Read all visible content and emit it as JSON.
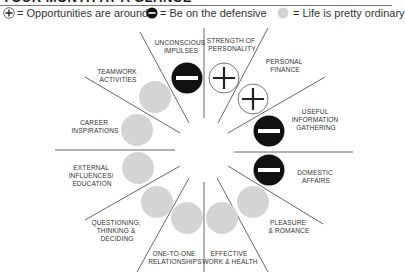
{
  "title": "YOUR MONTH AT A GLANCE",
  "legend": {
    "plus": "= Opportunities are around",
    "minus": "= Be on the defensive",
    "neutral": "= Life is pretty ordinary"
  },
  "colors": {
    "plus_fill": "#ffffff",
    "minus_fill": "#111111",
    "neutral_fill": "#d4d4d4",
    "line": "#555555"
  },
  "sectors": [
    {
      "name": "unconscious-impulses",
      "lines": [
        "UNCONSCIOUS",
        "IMPULSES"
      ],
      "status": "minus"
    },
    {
      "name": "strength-of-personality",
      "lines": [
        "STRENGTH OF",
        "PERSONALITY"
      ],
      "status": "plus"
    },
    {
      "name": "personal-finance",
      "lines": [
        "PERSONAL",
        "FINANCE"
      ],
      "status": "plus"
    },
    {
      "name": "useful-information-gathering",
      "lines": [
        "USEFUL",
        "INFORMATION",
        "GATHERING"
      ],
      "status": "minus"
    },
    {
      "name": "domestic-affairs",
      "lines": [
        "DOMESTIC",
        "AFFAIRS"
      ],
      "status": "minus"
    },
    {
      "name": "pleasure-romance",
      "lines": [
        "PLEASURE",
        "& ROMANCE"
      ],
      "status": "neutral"
    },
    {
      "name": "effective-work-health",
      "lines": [
        "EFFECTIVE",
        "WORK & HEALTH"
      ],
      "status": "neutral"
    },
    {
      "name": "one-to-one-relationships",
      "lines": [
        "ONE-TO-ONE",
        "RELATIONSHIPS"
      ],
      "status": "neutral"
    },
    {
      "name": "questioning-thinking-deciding",
      "lines": [
        "QUESTIONING,",
        "THINKING &",
        "DECIDING"
      ],
      "status": "neutral"
    },
    {
      "name": "external-influences-education",
      "lines": [
        "EXTERNAL",
        "INFLUENCES/",
        "EDUCATION"
      ],
      "status": "neutral"
    },
    {
      "name": "career-inspirations",
      "lines": [
        "CAREER",
        "INSPIRATIONS"
      ],
      "status": "neutral"
    },
    {
      "name": "teamwork-activities",
      "lines": [
        "TEAMWORK",
        "ACTIVITIES"
      ],
      "status": "neutral"
    }
  ]
}
